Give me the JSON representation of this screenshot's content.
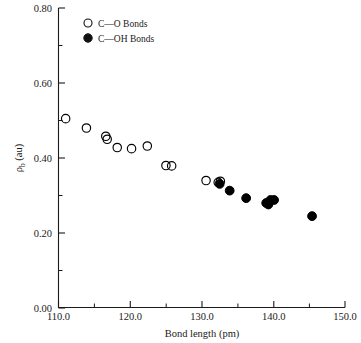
{
  "chart_data": {
    "type": "scatter",
    "title": "",
    "xlabel": "Bond length (pm)",
    "ylabel": "ρb (au)",
    "ylabel_main": "ρ",
    "ylabel_sub": "b",
    "ylabel_unit": " (au)",
    "xlim": [
      110.0,
      150.0
    ],
    "ylim": [
      0.0,
      0.8
    ],
    "xticks": [
      110.0,
      120.0,
      130.0,
      140.0,
      150.0
    ],
    "xtick_labels": [
      "110.0",
      "120.0",
      "130.0",
      "140.0",
      "150.0"
    ],
    "xminor_ticks": [
      115.0,
      125.0,
      135.0,
      145.0
    ],
    "yticks": [
      0.0,
      0.2,
      0.4,
      0.6,
      0.8
    ],
    "ytick_labels": [
      "0.00",
      "0.20",
      "0.40",
      "0.60",
      "0.80"
    ],
    "yminor_ticks": [
      0.1,
      0.3,
      0.5,
      0.7
    ],
    "grid": false,
    "legend_position": "top-left-inside",
    "series": [
      {
        "name": "C—O Bonds",
        "marker": "open-circle",
        "color": "#000000",
        "points": [
          [
            111.0,
            0.505
          ],
          [
            113.9,
            0.48
          ],
          [
            116.6,
            0.458
          ],
          [
            116.8,
            0.45
          ],
          [
            118.2,
            0.428
          ],
          [
            120.2,
            0.425
          ],
          [
            122.4,
            0.432
          ],
          [
            125.0,
            0.38
          ],
          [
            125.8,
            0.379
          ],
          [
            130.6,
            0.34
          ],
          [
            132.3,
            0.335
          ],
          [
            132.6,
            0.338
          ]
        ]
      },
      {
        "name": "C—OH Bonds",
        "marker": "filled-circle",
        "color": "#000000",
        "points": [
          [
            132.5,
            0.331
          ],
          [
            133.9,
            0.313
          ],
          [
            136.2,
            0.293
          ],
          [
            139.0,
            0.28
          ],
          [
            139.3,
            0.276
          ],
          [
            139.6,
            0.288
          ],
          [
            140.1,
            0.288
          ],
          [
            145.4,
            0.245
          ]
        ]
      }
    ]
  },
  "legend": {
    "entries": [
      {
        "label": "C—O Bonds",
        "marker": "open-circle"
      },
      {
        "label": "C—OH Bonds",
        "marker": "filled-circle"
      }
    ]
  }
}
